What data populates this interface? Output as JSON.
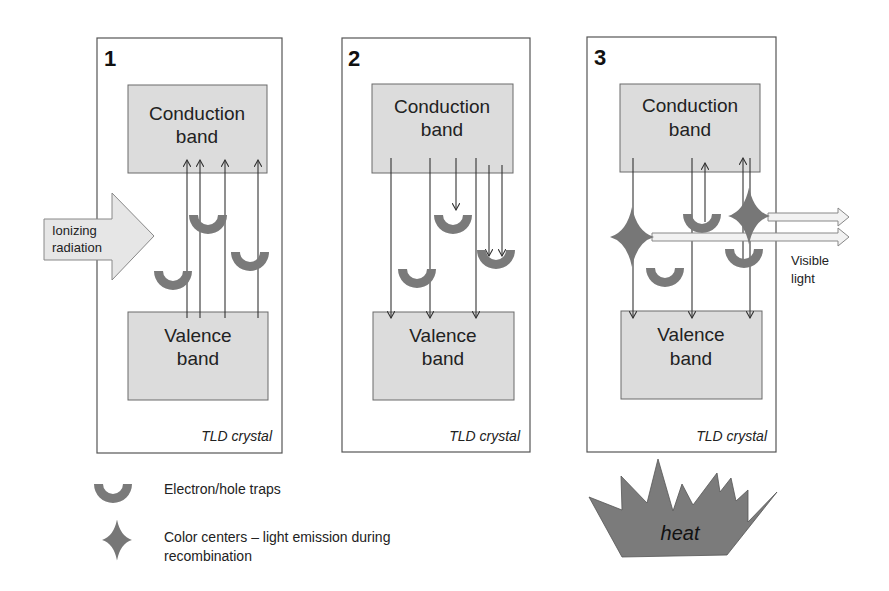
{
  "panels": [
    {
      "number": "1",
      "conduction_band": [
        "Conduction",
        "band"
      ],
      "valence_band": [
        "Valence",
        "band"
      ],
      "label": "TLD crystal"
    },
    {
      "number": "2",
      "conduction_band": [
        "Conduction",
        "band"
      ],
      "valence_band": [
        "Valence",
        "band"
      ],
      "label": "TLD crystal"
    },
    {
      "number": "3",
      "conduction_band": [
        "Conduction",
        "band"
      ],
      "valence_band": [
        "Valence",
        "band"
      ],
      "label": "TLD crystal"
    }
  ],
  "ionizing_arrow": [
    "Ionizing",
    "radiation"
  ],
  "visible_light": [
    "Visible",
    "light"
  ],
  "heat_label": "heat",
  "legend": {
    "traps": "Electron/hole traps",
    "color_centers_line1": "Color centers – light emission during",
    "color_centers_line2": "recombination"
  },
  "colors": {
    "band_fill": "#dcdcdc",
    "trap_fill": "#7a7a7a",
    "heat_fill": "#7b7b7b"
  }
}
